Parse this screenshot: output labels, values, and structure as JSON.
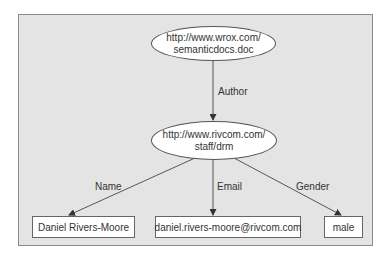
{
  "diagram": {
    "type": "RDF graph",
    "nodes": {
      "document": {
        "shape": "ellipse",
        "line1": "http://www.wrox.com/",
        "line2": "semanticdocs.doc"
      },
      "person": {
        "shape": "ellipse",
        "line1": "http://www.rivcom.com/",
        "line2": "staff/drm"
      },
      "name_value": {
        "shape": "rectangle",
        "label": "Daniel Rivers-Moore"
      },
      "email_value": {
        "shape": "rectangle",
        "label": "daniel.rivers-moore@rivcom.com"
      },
      "gender_value": {
        "shape": "rectangle",
        "label": "male"
      }
    },
    "edges": [
      {
        "from": "document",
        "to": "person",
        "label": "Author"
      },
      {
        "from": "person",
        "to": "name_value",
        "label": "Name"
      },
      {
        "from": "person",
        "to": "email_value",
        "label": "Email"
      },
      {
        "from": "person",
        "to": "gender_value",
        "label": "Gender"
      }
    ],
    "colors": {
      "panel_background": "#e4e4e4",
      "panel_border": "#8a8a8a",
      "node_fill": "#ffffff",
      "line": "#555555",
      "text": "#333333"
    }
  }
}
